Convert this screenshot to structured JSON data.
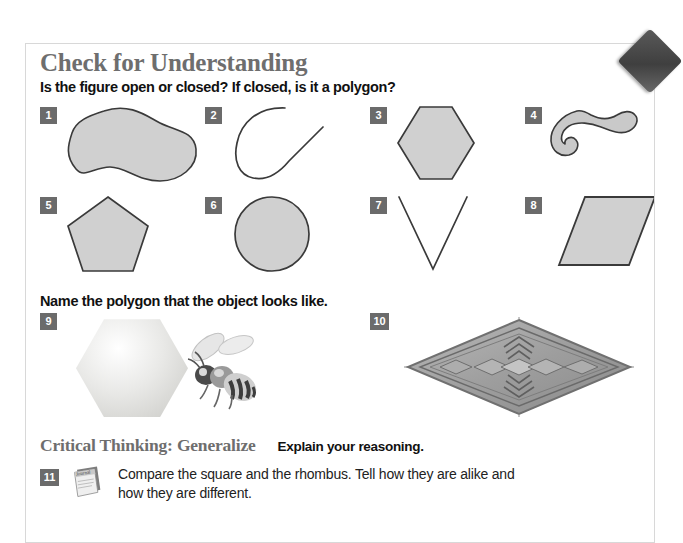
{
  "page": {
    "title": "Check for Understanding",
    "instruction_1": "Is the figure open or closed? If closed, is it a polygon?",
    "instruction_2": "Name the polygon that the object looks like.",
    "critical_thinking_label": "Critical Thinking: Generalize",
    "critical_thinking_prompt": "Explain your reasoning."
  },
  "figures": [
    {
      "number": "1",
      "shape": "blob",
      "open": false,
      "description": "peanut-shaped closed blob"
    },
    {
      "number": "2",
      "shape": "open-curve",
      "open": true,
      "description": "open curved line with straight tail"
    },
    {
      "number": "3",
      "shape": "hexagon",
      "open": false,
      "description": "regular hexagon"
    },
    {
      "number": "4",
      "shape": "hook",
      "open": false,
      "description": "thick hook / spiral worm shape"
    },
    {
      "number": "5",
      "shape": "pentagon",
      "open": false,
      "description": "regular pentagon"
    },
    {
      "number": "6",
      "shape": "circle",
      "open": false,
      "description": "circle"
    },
    {
      "number": "7",
      "shape": "vee",
      "open": true,
      "description": "open V made of two segments"
    },
    {
      "number": "8",
      "shape": "parallelogram",
      "open": false,
      "description": "slanted parallelogram"
    }
  ],
  "objects": [
    {
      "number": "9",
      "object": "honeycomb-cell-with-bee",
      "answer_shape": "hexagon"
    },
    {
      "number": "10",
      "object": "diamond-rug",
      "answer_shape": "rhombus"
    }
  ],
  "question_11": {
    "number": "11",
    "icon": "journal-icon",
    "text": "Compare the square and the rhombus. Tell how they are alike and how they are different."
  },
  "colors": {
    "heading_gray": "#6e6e6e",
    "badge_gray": "#6b6b6b",
    "shape_fill": "#d0d0d0",
    "shape_stroke": "#3a3a3a",
    "page_border": "#d8d8d8",
    "body_text": "#222222"
  }
}
